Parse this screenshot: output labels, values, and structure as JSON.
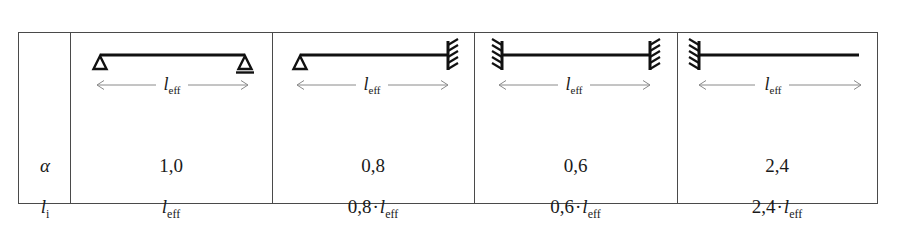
{
  "table": {
    "row_labels": {
      "alpha": "α",
      "l_i_symbol": "l",
      "l_i_subscript": "i"
    },
    "length_label": {
      "symbol": "l",
      "subscript": "eff"
    },
    "multiplication_sign": "·",
    "columns": [
      {
        "name": "simply-supported",
        "left_support": "pin",
        "right_support": "roller",
        "dimension_label": "l_eff",
        "alpha": "1,0",
        "l_i_coefficient": "",
        "l_i": "l_eff"
      },
      {
        "name": "pinned-fixed",
        "left_support": "pin",
        "right_support": "fixed",
        "dimension_label": "l_eff",
        "alpha": "0,8",
        "l_i_coefficient": "0,8",
        "l_i": "0,8 · l_eff"
      },
      {
        "name": "fixed-fixed",
        "left_support": "fixed",
        "right_support": "fixed",
        "dimension_label": "l_eff",
        "alpha": "0,6",
        "l_i_coefficient": "0,6",
        "l_i": "0,6 · l_eff"
      },
      {
        "name": "cantilever",
        "left_support": "fixed",
        "right_support": "free",
        "dimension_label": "l_eff",
        "alpha": "2,4",
        "l_i_coefficient": "2,4",
        "l_i": "2,4 · l_eff"
      }
    ]
  },
  "colors": {
    "border": "#4a4a4a",
    "beam": "#111111",
    "dimension_line": "#8a8a8a",
    "text": "#1a1a1a"
  }
}
